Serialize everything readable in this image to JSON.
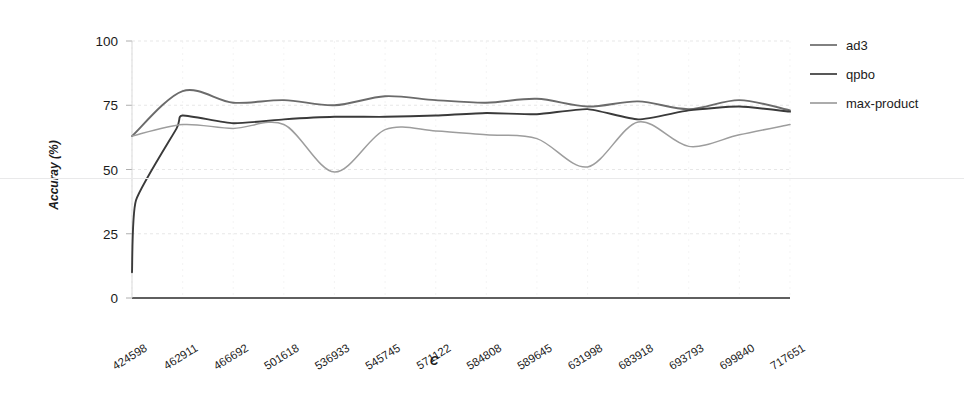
{
  "chart_data": {
    "type": "line",
    "title": "",
    "xlabel": "C",
    "ylabel": "Accuray (%)",
    "ylim": [
      0,
      100
    ],
    "yticks": [
      0,
      25,
      50,
      75,
      100
    ],
    "grid": "faint dashed horizontal and vertical gridlines",
    "legend_position": "right",
    "categories": [
      "424598",
      "462911",
      "466692",
      "501618",
      "536933",
      "545745",
      "571122",
      "584808",
      "589645",
      "631998",
      "683918",
      "693793",
      "699840",
      "717651"
    ],
    "series": [
      {
        "name": "ad3",
        "color": "#6b6b6b",
        "values": [
          63.0,
          80.5,
          76.0,
          77.0,
          75.0,
          78.5,
          77.0,
          76.0,
          77.5,
          74.5,
          76.5,
          73.5,
          77.0,
          73.0
        ]
      },
      {
        "name": "qpbo",
        "color": "#3a3a3a",
        "values": [
          10.0,
          71.0,
          68.0,
          69.5,
          70.5,
          70.5,
          71.0,
          72.0,
          71.5,
          73.5,
          69.5,
          73.0,
          74.5,
          72.5
        ]
      },
      {
        "name": "max-product",
        "color": "#9d9d9d",
        "values": [
          63.0,
          67.5,
          66.0,
          67.5,
          49.0,
          65.5,
          65.0,
          63.5,
          62.0,
          51.0,
          68.5,
          59.0,
          63.5,
          67.5
        ]
      }
    ],
    "annotations": {
      "qpbo_left_start_note": "qpbo rises steeply from ~10 at the first category",
      "max_product_dips": [
        "~49 near 536933",
        "~51 near 631998"
      ]
    }
  },
  "legend": {
    "items": [
      {
        "label": "ad3"
      },
      {
        "label": "qpbo"
      },
      {
        "label": "max-product"
      }
    ]
  },
  "axes": {
    "y": {
      "label": "Accuray (%)",
      "ticks": [
        "100",
        "75",
        "50",
        "25",
        "0"
      ]
    },
    "x": {
      "label": "C",
      "ticks": [
        "424598",
        "462911",
        "466692",
        "501618",
        "536933",
        "545745",
        "571122",
        "584808",
        "589645",
        "631998",
        "683918",
        "693793",
        "699840",
        "717651"
      ]
    }
  }
}
